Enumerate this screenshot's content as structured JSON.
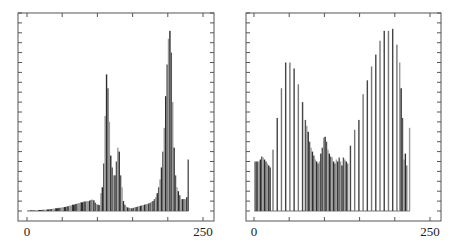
{
  "chart_data": [
    {
      "type": "bar",
      "title": "",
      "xlabel": "",
      "ylabel": "",
      "xlim": [
        0,
        250
      ],
      "ylim": [
        0,
        100
      ],
      "x_tick_labels": [
        "0",
        "250"
      ],
      "x_ticks": [
        0,
        50,
        100,
        150,
        200,
        250
      ],
      "y_ticks": [
        0,
        5,
        10,
        15,
        20,
        25,
        30,
        35,
        40,
        45,
        50,
        55,
        60,
        65,
        70,
        75,
        80,
        85,
        90,
        95,
        100
      ],
      "grid": false,
      "legend": "none",
      "bar_color": "#3a3a3a",
      "x": [
        0,
        4,
        8,
        12,
        16,
        20,
        24,
        28,
        32,
        36,
        40,
        44,
        48,
        52,
        56,
        60,
        64,
        68,
        72,
        76,
        80,
        84,
        88,
        90,
        92,
        94,
        96,
        98,
        100,
        102,
        104,
        106,
        108,
        110,
        112,
        114,
        116,
        118,
        120,
        122,
        124,
        126,
        128,
        130,
        132,
        134,
        136,
        138,
        140,
        142,
        144,
        146,
        148,
        150,
        152,
        154,
        156,
        158,
        160,
        162,
        164,
        166,
        168,
        170,
        172,
        174,
        176,
        178,
        180,
        182,
        184,
        186,
        188,
        190,
        192,
        194,
        196,
        198,
        200,
        202,
        204,
        206,
        208,
        210,
        212,
        214,
        216,
        218,
        220,
        222,
        224,
        226,
        228
      ],
      "values": [
        0.3,
        0.3,
        0.3,
        0.4,
        0.5,
        0.6,
        0.7,
        0.8,
        1.0,
        1.2,
        1.4,
        1.6,
        1.8,
        2.0,
        2.4,
        2.8,
        3.2,
        3.6,
        4.0,
        4.4,
        4.8,
        5.0,
        5.2,
        5.6,
        5.8,
        5.4,
        4.2,
        3.4,
        3.2,
        3.0,
        9.0,
        12.0,
        24.0,
        48.0,
        69.0,
        62.0,
        45.0,
        28.0,
        22.0,
        18.0,
        18.0,
        25.0,
        32.0,
        30.0,
        18.0,
        12.0,
        5.0,
        3.2,
        2.2,
        1.8,
        1.6,
        1.4,
        1.4,
        1.6,
        1.8,
        2.0,
        2.2,
        2.4,
        2.6,
        2.8,
        3.0,
        3.2,
        3.4,
        3.6,
        3.8,
        4.2,
        4.6,
        5.0,
        6.0,
        7.0,
        9.0,
        12.0,
        16.0,
        22.0,
        30.0,
        42.0,
        58.0,
        74.0,
        87.0,
        91.0,
        80.0,
        55.0,
        32.0,
        18.0,
        12.0,
        10.0,
        8.0,
        6.0,
        6.0,
        6.0,
        6.0,
        7.0,
        26.0
      ]
    },
    {
      "type": "bar",
      "title": "",
      "xlabel": "",
      "ylabel": "",
      "xlim": [
        0,
        250
      ],
      "ylim": [
        0,
        100
      ],
      "x_tick_labels": [
        "0",
        "250"
      ],
      "x_ticks": [
        0,
        50,
        100,
        150,
        200,
        250
      ],
      "y_ticks": [
        0,
        5,
        10,
        15,
        20,
        25,
        30,
        35,
        40,
        45,
        50,
        55,
        60,
        65,
        70,
        75,
        80,
        85,
        90,
        95,
        100
      ],
      "grid": false,
      "legend": "none",
      "bar_color": "#3a3a3a",
      "x": [
        0,
        2,
        4,
        6,
        8,
        10,
        12,
        14,
        16,
        18,
        20,
        22,
        26,
        32,
        38,
        44,
        50,
        56,
        62,
        68,
        72,
        74,
        76,
        78,
        80,
        82,
        84,
        86,
        88,
        90,
        92,
        94,
        96,
        98,
        100,
        102,
        104,
        106,
        108,
        110,
        112,
        114,
        116,
        118,
        120,
        122,
        124,
        126,
        128,
        130,
        132,
        136,
        142,
        148,
        154,
        160,
        166,
        172,
        178,
        184,
        190,
        196,
        202,
        206,
        208,
        210,
        212,
        214,
        216,
        220
      ],
      "values": [
        25.0,
        25.0,
        25.0,
        25.0,
        26.0,
        27.5,
        27.0,
        26.0,
        25.0,
        24.0,
        23.0,
        22.0,
        31.0,
        47.0,
        62.0,
        75.0,
        75.0,
        72.0,
        64.0,
        55.0,
        46.0,
        43.0,
        40.0,
        35.0,
        32.0,
        30.0,
        28.0,
        26.0,
        25.0,
        24.0,
        25.0,
        29.0,
        32.0,
        37.0,
        37.5,
        35.0,
        31.0,
        29.0,
        27.5,
        27.0,
        25.0,
        24.0,
        26.0,
        25.0,
        27.0,
        25.0,
        23.0,
        27.0,
        26.0,
        25.0,
        24.0,
        33.0,
        41.0,
        46.0,
        59.0,
        66.0,
        73.0,
        79.0,
        86.0,
        91.0,
        91.0,
        92.0,
        84.0,
        75.0,
        62.0,
        47.0,
        26.0,
        29.0,
        23.0,
        42.0
      ]
    }
  ]
}
